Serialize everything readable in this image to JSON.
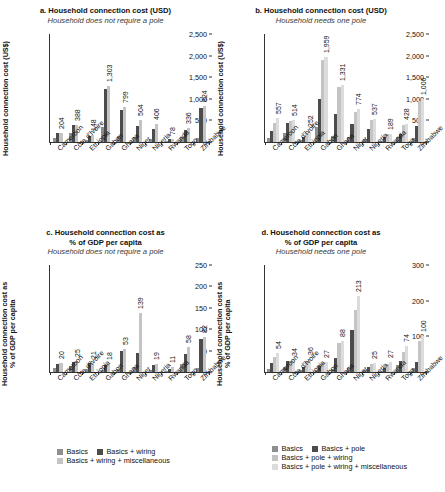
{
  "figure": {
    "countries": [
      "Cameroon",
      "Côte d'Ivoire",
      "Ethiopia",
      "Gabon",
      "Ghana",
      "Niger",
      "Nigeria",
      "Rwanda",
      "Togo",
      "Zimbabwe"
    ]
  },
  "legend_left": {
    "items": [
      {
        "label": "Basics",
        "color": "#8f8f8f"
      },
      {
        "label": "Basics + wiring",
        "color": "#4c4c4c"
      },
      {
        "label": "Basics + wiring + miscellaneous",
        "color": "#c4c4c4"
      }
    ]
  },
  "legend_right": {
    "items": [
      {
        "label": "Basics",
        "color": "#8f8f8f"
      },
      {
        "label": "Basics + pole",
        "color": "#4c4c4c"
      },
      {
        "label": "Basics + pole + wiring",
        "color": "#c4c4c4"
      },
      {
        "label": "Basics + pole + wiring + miscellaneous",
        "color": "#dcdcdc"
      }
    ]
  },
  "chart_data": [
    {
      "id": "a",
      "type": "bar",
      "title": "a. Household connection cost (USD)",
      "subtitle": "Household does not require a pole",
      "xlabel": "",
      "ylabel": "Household connection cost (US$)",
      "ylim": [
        0,
        2500
      ],
      "yticks": [
        0,
        500,
        1000,
        1500,
        2000,
        2500
      ],
      "ytick_labels": [
        "0",
        "500",
        "1,000",
        "1,500",
        "2,000",
        "2,500"
      ],
      "grid": false,
      "legend_position": "bottom",
      "categories": [
        "Cameroon",
        "Côte d'Ivoire",
        "Ethiopia",
        "Gabon",
        "Ghana",
        "Niger",
        "Nigeria",
        "Rwanda",
        "Togo",
        "Zimbabwe"
      ],
      "series": [
        {
          "name": "Basics",
          "color": "#8f8f8f",
          "values": [
            88,
            210,
            46,
            344,
            140,
            120,
            60,
            30,
            112,
            95
          ]
        },
        {
          "name": "Basics + wiring",
          "color": "#4c4c4c",
          "values": [
            204,
            388,
            148,
            1230,
            730,
            360,
            300,
            78,
            280,
            780
          ]
        },
        {
          "name": "Basics + wiring + miscellaneous",
          "color": "#c4c4c4",
          "values": [
            215,
            400,
            155,
            1303,
            799,
            504,
            406,
            80,
            336,
            824
          ]
        }
      ],
      "data_labels": [
        204,
        388,
        148,
        1303,
        799,
        504,
        406,
        78,
        336,
        824
      ]
    },
    {
      "id": "b",
      "type": "bar",
      "title": "b. Household connection cost (USD)",
      "subtitle": "Household needs one pole",
      "xlabel": "",
      "ylabel": "Household connection cost (US$)",
      "ylim": [
        0,
        2500
      ],
      "yticks": [
        0,
        500,
        1000,
        1500,
        2000,
        2500
      ],
      "ytick_labels": [
        "0",
        "500",
        "1,000",
        "1,500",
        "2,000",
        "2,500"
      ],
      "grid": false,
      "legend_position": "bottom",
      "categories": [
        "Cameroon",
        "Côte d'Ivoire",
        "Ethiopia",
        "Gabon",
        "Ghana",
        "Niger",
        "Nigeria",
        "Rwanda",
        "Togo",
        "Zimbabwe"
      ],
      "series": [
        {
          "name": "Basics",
          "color": "#8f8f8f",
          "values": [
            90,
            205,
            50,
            345,
            140,
            120,
            62,
            32,
            112,
            100
          ]
        },
        {
          "name": "Basics + pole",
          "color": "#4c4c4c",
          "values": [
            250,
            430,
            110,
            1000,
            660,
            420,
            300,
            120,
            180,
            360
          ]
        },
        {
          "name": "Basics + pole + wiring",
          "color": "#c4c4c4",
          "values": [
            430,
            490,
            200,
            1890,
            1270,
            690,
            510,
            180,
            390,
            960
          ]
        },
        {
          "name": "Basics + pole + wiring + miscellaneous",
          "color": "#dcdcdc",
          "values": [
            557,
            514,
            252,
            1959,
            1331,
            774,
            537,
            189,
            428,
            1006
          ]
        }
      ],
      "data_labels": [
        557,
        514,
        252,
        1959,
        1331,
        774,
        537,
        189,
        428,
        1006
      ]
    },
    {
      "id": "c",
      "type": "bar",
      "title": "c. Household connection cost as\n% of GDP per capita",
      "subtitle": "Household does not require a pole",
      "xlabel": "",
      "ylabel": "Household connection cost as\n% of GDP per capita",
      "ylim": [
        0,
        250
      ],
      "yticks": [
        0,
        50,
        100,
        150,
        200,
        250
      ],
      "ytick_labels": [
        "0",
        "50",
        "100",
        "150",
        "200",
        "250"
      ],
      "grid": false,
      "legend_position": "bottom",
      "categories": [
        "Cameroon",
        "Côte d'Ivoire",
        "Ethiopia",
        "Gabon",
        "Ghana",
        "Niger",
        "Nigeria",
        "Rwanda",
        "Togo",
        "Zimbabwe"
      ],
      "series": [
        {
          "name": "Basics",
          "color": "#8f8f8f",
          "values": [
            9,
            13,
            6,
            5,
            8,
            12,
            5,
            3,
            19,
            10
          ]
        },
        {
          "name": "Basics + wiring",
          "color": "#4c4c4c",
          "values": [
            19,
            24,
            20,
            17,
            48,
            44,
            17,
            8,
            43,
            77
          ]
        },
        {
          "name": "Basics + wiring + miscellaneous",
          "color": "#c4c4c4",
          "values": [
            20,
            25,
            21,
            18,
            53,
            139,
            19,
            11,
            58,
            82
          ]
        }
      ],
      "data_labels": [
        20,
        25,
        21,
        18,
        53,
        139,
        19,
        11,
        58,
        82
      ]
    },
    {
      "id": "d",
      "type": "bar",
      "title": "d. Household connection cost as\n% of GDP per capita",
      "subtitle": "Household needs one pole",
      "xlabel": "",
      "ylabel": "Household connection cost as\n% of GDP per capita",
      "ylim": [
        0,
        300
      ],
      "yticks": [
        0,
        100,
        200,
        300
      ],
      "ytick_labels": [
        "0",
        "100",
        "200",
        "300"
      ],
      "grid": false,
      "legend_position": "bottom",
      "categories": [
        "Cameroon",
        "Côte d'Ivoire",
        "Ethiopia",
        "Gabon",
        "Ghana",
        "Niger",
        "Nigeria",
        "Rwanda",
        "Togo",
        "Zimbabwe"
      ],
      "series": [
        {
          "name": "Basics",
          "color": "#8f8f8f",
          "values": [
            9,
            13,
            6,
            5,
            8,
            12,
            5,
            3,
            19,
            10
          ]
        },
        {
          "name": "Basics + pole",
          "color": "#4c4c4c",
          "values": [
            26,
            30,
            13,
            16,
            38,
            117,
            14,
            12,
            31,
            27
          ]
        },
        {
          "name": "Basics + pole + wiring",
          "color": "#c4c4c4",
          "values": [
            42,
            32,
            30,
            24,
            80,
            175,
            22,
            23,
            55,
            88
          ]
        },
        {
          "name": "Basics + pole + wiring + miscellaneous",
          "color": "#dcdcdc",
          "values": [
            54,
            34,
            36,
            27,
            88,
            213,
            25,
            27,
            74,
            100
          ]
        }
      ],
      "data_labels": [
        54,
        34,
        36,
        27,
        88,
        213,
        25,
        27,
        74,
        100
      ]
    }
  ]
}
